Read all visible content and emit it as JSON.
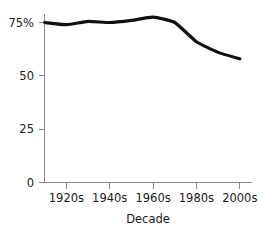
{
  "chart_data": {
    "type": "line",
    "title": "",
    "subtitle": "",
    "xlabel": "Decade",
    "ylabel": "",
    "categories": [
      "1910s",
      "1920s",
      "1930s",
      "1940s",
      "1950s",
      "1960s",
      "1970s",
      "1980s",
      "1990s",
      "2000s"
    ],
    "x": [
      1910,
      1920,
      1930,
      1940,
      1950,
      1960,
      1970,
      1980,
      1990,
      2000
    ],
    "values": [
      75.0,
      74.0,
      75.5,
      75.0,
      76.0,
      77.5,
      75.0,
      66.0,
      61.0,
      58.0
    ],
    "series": [
      {
        "name": "",
        "values": [
          75.0,
          74.0,
          75.5,
          75.0,
          76.0,
          77.5,
          75.0,
          66.0,
          61.0,
          58.0
        ]
      }
    ],
    "xlim": [
      1905,
      2005
    ],
    "ylim": [
      0,
      82
    ],
    "xticks": [
      1920,
      1940,
      1960,
      1980,
      2000
    ],
    "xticklabels": [
      "1920s",
      "1940s",
      "1960s",
      "1980s",
      "2000s"
    ],
    "yticks": [
      0,
      25,
      50,
      75
    ],
    "yticklabels": [
      "0",
      "25",
      "50",
      "75%"
    ],
    "grid": false,
    "legend": false,
    "legend_position": "none",
    "line_color": "#111111",
    "axis_color": "#8a8a8a",
    "text_color": "#1a1a1a",
    "background_color": "#ffffff"
  }
}
